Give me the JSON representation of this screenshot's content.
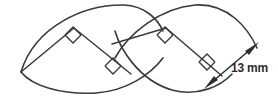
{
  "figure": {
    "background_color": "#ffffff",
    "stroke_color": "#3a3a3c",
    "text_color": "#2b2b2d",
    "dimension": {
      "value": "13",
      "unit": "mm",
      "label": "13 mm",
      "arrow_style": "double-headed"
    },
    "right_angle_marks": [
      {
        "id": "left-lens-upper",
        "label": "right-angle"
      },
      {
        "id": "center-lower",
        "label": "right-angle"
      },
      {
        "id": "right-lens-upper",
        "label": "right-angle"
      },
      {
        "id": "right-lens-lower",
        "label": "right-angle"
      }
    ]
  }
}
